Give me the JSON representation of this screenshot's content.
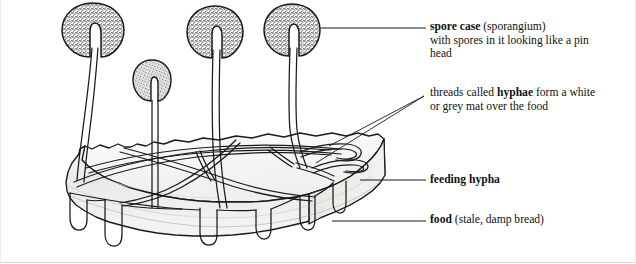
{
  "figure": {
    "background_color": "#ffffff",
    "ink_color": "#1a1a1a",
    "stipple_color": "#8f8f8f",
    "bread_face_color": "#f2f2f0",
    "bread_side_color": "#e6e6e4"
  },
  "labels": {
    "spore_case": {
      "line1_bold": "spore case",
      "line1_rest": " (sporangium)",
      "line2": "with spores in it looking like a pin",
      "line3": "head"
    },
    "hyphae": {
      "line1_pre": "threads called ",
      "line1_bold": "hyphae",
      "line1_post": " form a white",
      "line2": "or grey mat over the food"
    },
    "feeding_hypha": {
      "bold": "feeding hypha"
    },
    "food": {
      "bold": "food",
      "rest": " (stale, damp bread)"
    }
  },
  "parts": {
    "sporangium_1": "spore-case-large-left",
    "sporangium_2": "spore-case-small",
    "sporangium_3": "spore-case-large-middle",
    "sporangium_4": "spore-case-large-right",
    "stalk": "sporangiophore-stalk",
    "mat": "hyphae-mat",
    "rhizoid": "feeding-hypha-rhizoid",
    "substrate": "bread-slab"
  },
  "counts": {
    "spore_cases": 4,
    "leader_lines": 5
  }
}
